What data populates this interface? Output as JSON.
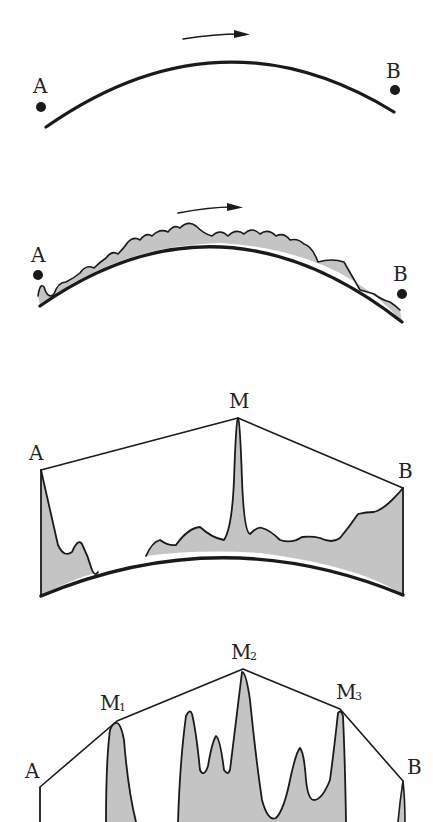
{
  "colors": {
    "ink": "#1a1a1a",
    "fill": "#c4c4c4",
    "background": "#ffffff"
  },
  "figures": [
    {
      "id": "panel-1",
      "description": "Smooth arc from A to B with direction arrow",
      "labels": {
        "start": "A",
        "end": "B"
      },
      "arrow": "direction-arrow"
    },
    {
      "id": "panel-2",
      "description": "Arc with wavy shaded profile above it from A to B with direction arrow",
      "labels": {
        "start": "A",
        "end": "B"
      },
      "arrow": "direction-arrow"
    },
    {
      "id": "panel-3",
      "description": "Shaded profile over arc with single peak M; convex hull A-M-B",
      "labels": {
        "start": "A",
        "peak": "M",
        "end": "B"
      }
    },
    {
      "id": "panel-4",
      "description": "Shaded profile with several peaks; hull A-M1-M2-M3-B",
      "labels": {
        "start": "A",
        "peak1": "M",
        "peak1_sub": "1",
        "peak2": "M",
        "peak2_sub": "2",
        "peak3": "M",
        "peak3_sub": "3",
        "end": "B"
      }
    }
  ]
}
